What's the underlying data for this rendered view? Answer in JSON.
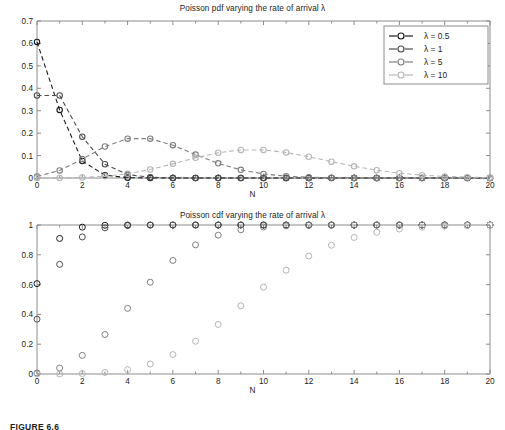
{
  "figure": {
    "caption": "FIGURE 6.6",
    "background_color": "#ffffff"
  },
  "colors": {
    "series_1": "#1a1a1a",
    "series_2": "#4d4d4d",
    "series_3": "#7f7f7f",
    "series_4": "#b5b5b5",
    "axis": "#8c8c8c",
    "text": "#1c1c1c",
    "legend_border": "#8c8c8c"
  },
  "legend": {
    "position": "top-right",
    "entries": [
      {
        "label": "λ = 0.5",
        "color": "#1a1a1a",
        "marker": "circle",
        "line": "dashed"
      },
      {
        "label": "λ = 1",
        "color": "#4d4d4d",
        "marker": "circle",
        "line": "dashed"
      },
      {
        "label": "λ = 5",
        "color": "#7f7f7f",
        "marker": "circle",
        "line": "dashed"
      },
      {
        "label": "λ = 10",
        "color": "#b5b5b5",
        "marker": "circle",
        "line": "dashed"
      }
    ]
  },
  "chart_data": [
    {
      "type": "line",
      "id": "poisson-pdf",
      "title": "Poisson pdf varying the rate of arrival λ",
      "xlabel": "N",
      "ylabel": "",
      "xlim": [
        0,
        20
      ],
      "ylim": [
        0,
        0.7
      ],
      "xticks": [
        0,
        2,
        4,
        6,
        8,
        10,
        12,
        14,
        16,
        18,
        20
      ],
      "xtick_labels": [
        "0",
        "2",
        "4",
        "6",
        "8",
        "10",
        "12",
        "14",
        "16",
        "18",
        "20"
      ],
      "yticks": [
        0,
        0.1,
        0.2,
        0.3,
        0.4,
        0.5,
        0.6,
        0.7
      ],
      "ytick_labels": [
        "0",
        "0.1",
        "0.2",
        "0.3",
        "0.4",
        "0.5",
        "0.6",
        "0.7"
      ],
      "grid": false,
      "legend_position": "upper right",
      "x": [
        0,
        1,
        2,
        3,
        4,
        5,
        6,
        7,
        8,
        9,
        10,
        11,
        12,
        13,
        14,
        15,
        16,
        17,
        18,
        19,
        20
      ],
      "series": [
        {
          "name": "λ = 0.5",
          "color": "#1a1a1a",
          "values": [
            0.6065,
            0.3033,
            0.0758,
            0.0126,
            0.0016,
            0.0002,
            0.0,
            0.0,
            0.0,
            0.0,
            0.0,
            0.0,
            0.0,
            0.0,
            0.0,
            0.0,
            0.0,
            0.0,
            0.0,
            0.0,
            0.0
          ]
        },
        {
          "name": "λ = 1",
          "color": "#4d4d4d",
          "values": [
            0.3679,
            0.3679,
            0.1839,
            0.0613,
            0.0153,
            0.0031,
            0.0005,
            0.0001,
            0.0,
            0.0,
            0.0,
            0.0,
            0.0,
            0.0,
            0.0,
            0.0,
            0.0,
            0.0,
            0.0,
            0.0,
            0.0
          ]
        },
        {
          "name": "λ = 5",
          "color": "#7f7f7f",
          "values": [
            0.0067,
            0.0337,
            0.0842,
            0.1404,
            0.1755,
            0.1755,
            0.1462,
            0.1044,
            0.0653,
            0.0363,
            0.0181,
            0.0082,
            0.0034,
            0.0013,
            0.0005,
            0.0002,
            0.0,
            0.0,
            0.0,
            0.0,
            0.0
          ]
        },
        {
          "name": "λ = 10",
          "color": "#b5b5b5",
          "values": [
            0.0,
            0.0005,
            0.0023,
            0.0076,
            0.0189,
            0.0378,
            0.0631,
            0.0901,
            0.1126,
            0.1251,
            0.1251,
            0.1137,
            0.0948,
            0.0729,
            0.0521,
            0.0347,
            0.0217,
            0.0128,
            0.0071,
            0.0037,
            0.0019
          ]
        }
      ]
    },
    {
      "type": "scatter",
      "id": "poisson-cdf",
      "title": "Poisson cdf varying the rate of arrival λ",
      "xlabel": "N",
      "ylabel": "",
      "xlim": [
        0,
        20
      ],
      "ylim": [
        0,
        1
      ],
      "xticks": [
        0,
        2,
        4,
        6,
        8,
        10,
        12,
        14,
        16,
        18,
        20
      ],
      "xtick_labels": [
        "0",
        "2",
        "4",
        "6",
        "8",
        "10",
        "12",
        "14",
        "16",
        "18",
        "20"
      ],
      "yticks": [
        0,
        0.2,
        0.4,
        0.6,
        0.8,
        1
      ],
      "ytick_labels": [
        "0",
        "0.2",
        "0.4",
        "0.6",
        "0.8",
        "1"
      ],
      "grid": false,
      "legend_position": "none",
      "x": [
        0,
        1,
        2,
        3,
        4,
        5,
        6,
        7,
        8,
        9,
        10,
        11,
        12,
        13,
        14,
        15,
        16,
        17,
        18,
        19,
        20
      ],
      "series": [
        {
          "name": "λ = 0.5",
          "color": "#1a1a1a",
          "values": [
            0.6065,
            0.9098,
            0.9856,
            0.9982,
            0.9998,
            1.0,
            1.0,
            1.0,
            1.0,
            1.0,
            1.0,
            1.0,
            1.0,
            1.0,
            1.0,
            1.0,
            1.0,
            1.0,
            1.0,
            1.0,
            1.0
          ]
        },
        {
          "name": "λ = 1",
          "color": "#4d4d4d",
          "values": [
            0.3679,
            0.7358,
            0.9197,
            0.981,
            0.9963,
            0.9994,
            0.9999,
            1.0,
            1.0,
            1.0,
            1.0,
            1.0,
            1.0,
            1.0,
            1.0,
            1.0,
            1.0,
            1.0,
            1.0,
            1.0,
            1.0
          ]
        },
        {
          "name": "λ = 5",
          "color": "#7f7f7f",
          "values": [
            0.0067,
            0.0404,
            0.1247,
            0.265,
            0.4405,
            0.616,
            0.7622,
            0.8666,
            0.9319,
            0.9682,
            0.9863,
            0.9945,
            0.998,
            0.9993,
            0.9998,
            0.9999,
            1.0,
            1.0,
            1.0,
            1.0,
            1.0
          ]
        },
        {
          "name": "λ = 10",
          "color": "#b5b5b5",
          "values": [
            0.0,
            0.0005,
            0.0028,
            0.0103,
            0.0293,
            0.0671,
            0.1301,
            0.2202,
            0.3328,
            0.4579,
            0.583,
            0.6968,
            0.7916,
            0.8645,
            0.9165,
            0.9513,
            0.973,
            0.9857,
            0.9928,
            0.9965,
            0.9984
          ]
        }
      ]
    }
  ]
}
